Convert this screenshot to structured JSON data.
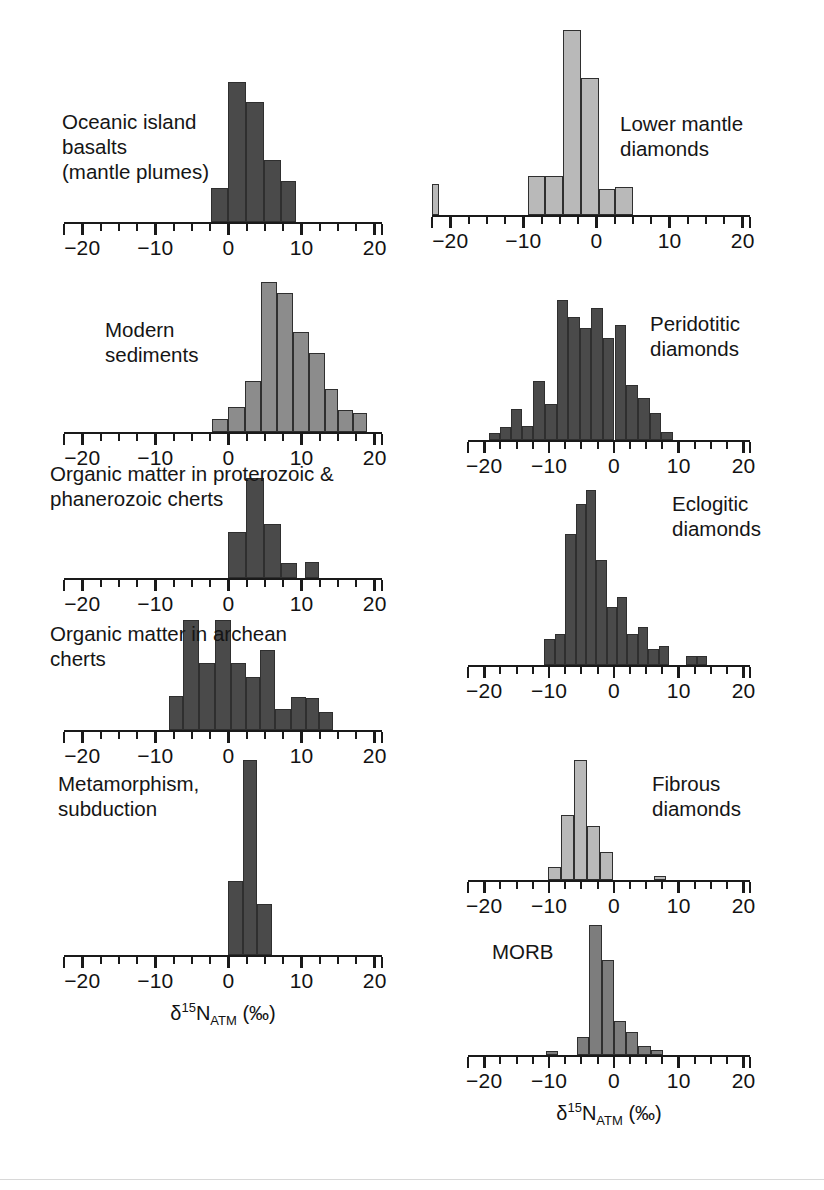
{
  "figure": {
    "axis_title_parts": {
      "delta": "δ",
      "mass": "15",
      "element": "N",
      "reservoir": "ATM",
      "units": "(‰)"
    },
    "axis_title_text": "δ15NATM (‰)",
    "x_axis": {
      "min": -22.5,
      "max": 21.0,
      "major_ticks": [
        -20,
        -10,
        0,
        10,
        20
      ],
      "major_tick_labels": [
        "−20",
        "−10",
        "0",
        "10",
        "20"
      ],
      "minor_tick_step": 2.5,
      "grid": false
    },
    "colors": {
      "bar_dark": "#4a4a4a",
      "bar_medium": "#8c8c8c",
      "bar_light": "#b9b9b9",
      "bar_outline": "#2f2f2f",
      "axis": "#1a1a1a",
      "text": "#151515",
      "background": "#ffffff"
    }
  },
  "chart_data": [
    {
      "type": "bar",
      "id": "oceanic-island-basalts",
      "title": "Oceanic island\nbasalts\n(mantle plumes)",
      "label_position": "left",
      "xlabel": "δ15NATM (‰)",
      "ylabel": "",
      "fill": "#4a4a4a",
      "bin_width": 2.4,
      "ymax": 10,
      "bins": [
        {
          "x0": -2.4,
          "x1": 0.0,
          "value": 2.4
        },
        {
          "x0": 0.0,
          "x1": 2.4,
          "value": 10.0
        },
        {
          "x0": 2.4,
          "x1": 4.8,
          "value": 8.6
        },
        {
          "x0": 4.8,
          "x1": 7.2,
          "value": 4.4
        },
        {
          "x0": 7.2,
          "x1": 9.2,
          "value": 2.9
        }
      ]
    },
    {
      "type": "bar",
      "id": "modern-sediments",
      "title": "Modern\nsediments",
      "label_position": "left",
      "xlabel": "δ15NATM (‰)",
      "ylabel": "",
      "fill": "#8c8c8c",
      "bin_width": 2.2,
      "ymax": 10,
      "bins": [
        {
          "x0": -2.2,
          "x1": 0.0,
          "value": 0.9
        },
        {
          "x0": 0.0,
          "x1": 2.2,
          "value": 1.7
        },
        {
          "x0": 2.2,
          "x1": 4.4,
          "value": 3.4
        },
        {
          "x0": 4.4,
          "x1": 6.6,
          "value": 10.0
        },
        {
          "x0": 6.6,
          "x1": 8.8,
          "value": 9.3
        },
        {
          "x0": 8.8,
          "x1": 11.0,
          "value": 6.7
        },
        {
          "x0": 11.0,
          "x1": 13.2,
          "value": 5.3
        },
        {
          "x0": 13.2,
          "x1": 15.0,
          "value": 2.9
        },
        {
          "x0": 15.0,
          "x1": 17.0,
          "value": 1.5
        },
        {
          "x0": 17.0,
          "x1": 19.0,
          "value": 1.3
        }
      ]
    },
    {
      "type": "bar",
      "id": "organic-matter-proterozoic-phanerozoic-cherts",
      "title": "Organic matter in proterozoic &\nphanerozoic cherts",
      "label_position": "top-left",
      "xlabel": "δ15NATM (‰)",
      "ylabel": "",
      "fill": "#4a4a4a",
      "bin_width": 2.4,
      "ymax": 10,
      "bins": [
        {
          "x0": 0.0,
          "x1": 2.4,
          "value": 4.6
        },
        {
          "x0": 2.4,
          "x1": 4.8,
          "value": 10.0
        },
        {
          "x0": 4.8,
          "x1": 7.2,
          "value": 5.4
        },
        {
          "x0": 7.2,
          "x1": 9.4,
          "value": 1.5
        },
        {
          "x0": 10.4,
          "x1": 12.4,
          "value": 1.6
        }
      ]
    },
    {
      "type": "bar",
      "id": "organic-matter-archean-cherts",
      "title": "Organic matter in archean\ncherts",
      "label_position": "top-left",
      "xlabel": "δ15NATM (‰)",
      "ylabel": "",
      "fill": "#4a4a4a",
      "bin_width": 2.3,
      "ymax": 10,
      "bins": [
        {
          "x0": -8.2,
          "x1": -6.2,
          "value": 3.1
        },
        {
          "x0": -6.2,
          "x1": -4.0,
          "value": 10.0
        },
        {
          "x0": -4.0,
          "x1": -1.9,
          "value": 6.1
        },
        {
          "x0": -1.9,
          "x1": 0.3,
          "value": 10.0
        },
        {
          "x0": 0.3,
          "x1": 2.4,
          "value": 6.1
        },
        {
          "x0": 2.4,
          "x1": 4.3,
          "value": 4.8
        },
        {
          "x0": 4.3,
          "x1": 6.4,
          "value": 7.3
        },
        {
          "x0": 6.4,
          "x1": 8.5,
          "value": 1.9
        },
        {
          "x0": 8.5,
          "x1": 10.6,
          "value": 3.0
        },
        {
          "x0": 10.6,
          "x1": 12.4,
          "value": 2.9
        },
        {
          "x0": 12.4,
          "x1": 14.3,
          "value": 1.6
        }
      ]
    },
    {
      "type": "bar",
      "id": "metamorphism-subduction",
      "title": "Metamorphism,\nsubduction",
      "label_position": "top-left",
      "xlabel": "δ15NATM (‰)",
      "ylabel": "",
      "fill": "#4a4a4a",
      "bin_width": 2.2,
      "ymax": 10,
      "bins": [
        {
          "x0": 0.0,
          "x1": 2.0,
          "value": 3.8
        },
        {
          "x0": 2.0,
          "x1": 3.9,
          "value": 10.0
        },
        {
          "x0": 3.9,
          "x1": 6.0,
          "value": 2.6
        }
      ]
    },
    {
      "type": "bar",
      "id": "lower-mantle-diamonds",
      "title": "Lower mantle\ndiamonds",
      "label_position": "right",
      "xlabel": "δ15NATM (‰)",
      "ylabel": "",
      "fill": "#b9b9b9",
      "bin_width": 2.4,
      "ymax": 10,
      "bins": [
        {
          "x0": -23.4,
          "x1": -21.6,
          "value": 1.7
        },
        {
          "x0": -9.3,
          "x1": -7.0,
          "value": 2.1
        },
        {
          "x0": -7.0,
          "x1": -4.6,
          "value": 2.1
        },
        {
          "x0": -4.6,
          "x1": -2.1,
          "value": 10.0
        },
        {
          "x0": -2.1,
          "x1": 0.4,
          "value": 7.4
        },
        {
          "x0": 0.4,
          "x1": 2.6,
          "value": 1.4
        },
        {
          "x0": 2.6,
          "x1": 5.0,
          "value": 1.5
        }
      ]
    },
    {
      "type": "bar",
      "id": "peridotitic-diamonds",
      "title": "Peridotitic\ndiamonds",
      "label_position": "right",
      "xlabel": "δ15NATM (‰)",
      "ylabel": "",
      "fill": "#4a4a4a",
      "bin_width": 1.75,
      "ymax": 10,
      "bins": [
        {
          "x0": -19.3,
          "x1": -17.6,
          "value": 0.5
        },
        {
          "x0": -17.6,
          "x1": -15.9,
          "value": 0.9
        },
        {
          "x0": -15.9,
          "x1": -14.2,
          "value": 2.2
        },
        {
          "x0": -14.2,
          "x1": -12.4,
          "value": 1.0
        },
        {
          "x0": -12.4,
          "x1": -10.6,
          "value": 4.2
        },
        {
          "x0": -10.6,
          "x1": -8.8,
          "value": 2.6
        },
        {
          "x0": -8.8,
          "x1": -7.0,
          "value": 10.0
        },
        {
          "x0": -7.0,
          "x1": -5.2,
          "value": 8.8
        },
        {
          "x0": -5.2,
          "x1": -3.5,
          "value": 8.0
        },
        {
          "x0": -3.5,
          "x1": -1.7,
          "value": 9.4
        },
        {
          "x0": -1.7,
          "x1": 0.1,
          "value": 7.3
        },
        {
          "x0": 0.1,
          "x1": 1.9,
          "value": 8.2
        },
        {
          "x0": 1.9,
          "x1": 3.7,
          "value": 3.9
        },
        {
          "x0": 3.7,
          "x1": 5.5,
          "value": 3.0
        },
        {
          "x0": 5.5,
          "x1": 7.3,
          "value": 1.9
        },
        {
          "x0": 7.3,
          "x1": 9.1,
          "value": 0.6
        }
      ]
    },
    {
      "type": "bar",
      "id": "eclogitic-diamonds",
      "title": "Eclogitic\ndiamonds",
      "label_position": "right",
      "xlabel": "δ15NATM (‰)",
      "ylabel": "",
      "fill": "#4a4a4a",
      "bin_width": 1.6,
      "ymax": 10,
      "bins": [
        {
          "x0": -10.7,
          "x1": -9.1,
          "value": 1.5
        },
        {
          "x0": -9.1,
          "x1": -7.5,
          "value": 1.8
        },
        {
          "x0": -7.5,
          "x1": -5.9,
          "value": 7.5
        },
        {
          "x0": -5.9,
          "x1": -4.3,
          "value": 9.2
        },
        {
          "x0": -4.3,
          "x1": -2.7,
          "value": 10.0
        },
        {
          "x0": -2.7,
          "x1": -1.1,
          "value": 6.0
        },
        {
          "x0": -1.1,
          "x1": 0.5,
          "value": 3.3
        },
        {
          "x0": 0.5,
          "x1": 2.1,
          "value": 3.9
        },
        {
          "x0": 2.1,
          "x1": 3.7,
          "value": 1.8
        },
        {
          "x0": 3.7,
          "x1": 5.3,
          "value": 2.2
        },
        {
          "x0": 5.3,
          "x1": 6.9,
          "value": 0.9
        },
        {
          "x0": 6.9,
          "x1": 8.5,
          "value": 1.1
        },
        {
          "x0": 11.2,
          "x1": 12.8,
          "value": 0.5
        },
        {
          "x0": 12.8,
          "x1": 14.4,
          "value": 0.5
        }
      ]
    },
    {
      "type": "bar",
      "id": "fibrous-diamonds",
      "title": "Fibrous\ndiamonds",
      "label_position": "right",
      "xlabel": "δ15NATM (‰)",
      "ylabel": "",
      "fill": "#b9b9b9",
      "bin_width": 2.0,
      "ymax": 10,
      "bins": [
        {
          "x0": -10.2,
          "x1": -8.2,
          "value": 1.1
        },
        {
          "x0": -8.2,
          "x1": -6.2,
          "value": 5.4
        },
        {
          "x0": -6.2,
          "x1": -4.1,
          "value": 10.0
        },
        {
          "x0": -4.1,
          "x1": -2.1,
          "value": 4.5
        },
        {
          "x0": -2.1,
          "x1": -0.1,
          "value": 2.3
        },
        {
          "x0": 6.2,
          "x1": 8.0,
          "value": 0.3
        }
      ]
    },
    {
      "type": "bar",
      "id": "morb",
      "title": "MORB",
      "label_position": "left",
      "xlabel": "δ15NATM (‰)",
      "ylabel": "",
      "fill": "#7d7d7d",
      "bin_width": 1.9,
      "ymax": 10,
      "bins": [
        {
          "x0": -10.5,
          "x1": -8.6,
          "value": 0.3
        },
        {
          "x0": -5.7,
          "x1": -3.8,
          "value": 1.4
        },
        {
          "x0": -3.8,
          "x1": -1.9,
          "value": 10.0
        },
        {
          "x0": -1.9,
          "x1": 0.0,
          "value": 7.3
        },
        {
          "x0": 0.0,
          "x1": 1.9,
          "value": 2.6
        },
        {
          "x0": 1.9,
          "x1": 3.8,
          "value": 1.8
        },
        {
          "x0": 3.8,
          "x1": 5.7,
          "value": 0.7
        },
        {
          "x0": 5.7,
          "x1": 7.6,
          "value": 0.4
        }
      ]
    }
  ],
  "panels": {
    "oceanic-island-basalts": {
      "label_text": "Oceanic island\nbasalts\n(mantle plumes)"
    },
    "modern-sediments": {
      "label_text": "Modern\nsediments"
    },
    "organic-matter-proterozoic-phanerozoic-cherts": {
      "label_text": "Organic matter in proterozoic &\nphanerozoic cherts"
    },
    "organic-matter-archean-cherts": {
      "label_text": "Organic matter in archean\ncherts"
    },
    "metamorphism-subduction": {
      "label_text": "Metamorphism,\nsubduction"
    },
    "lower-mantle-diamonds": {
      "label_text": "Lower mantle\ndiamonds"
    },
    "peridotitic-diamonds": {
      "label_text": "Peridotitic\ndiamonds"
    },
    "eclogitic-diamonds": {
      "label_text": "Eclogitic\ndiamonds"
    },
    "fibrous-diamonds": {
      "label_text": "Fibrous\ndiamonds"
    },
    "morb": {
      "label_text": "MORB"
    }
  }
}
